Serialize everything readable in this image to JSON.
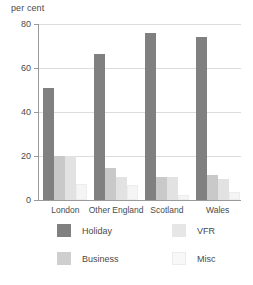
{
  "chart_data": {
    "type": "bar",
    "title": "",
    "subtitle": "",
    "xlabel": "",
    "ylabel": "per cent",
    "ylim": [
      0,
      80
    ],
    "yticks": [
      0,
      20,
      40,
      60,
      80
    ],
    "ytick_labels": [
      "0",
      "20",
      "40",
      "60",
      "80"
    ],
    "grid": true,
    "legend_position": "bottom",
    "categories": [
      "London",
      "Other England",
      "Scotland",
      "Wales"
    ],
    "series": [
      {
        "name": "Holiday",
        "color": "#808080",
        "values": [
          51,
          66.5,
          76,
          74
        ]
      },
      {
        "name": "Business",
        "color": "#c9c9c9",
        "values": [
          20,
          14.5,
          10.5,
          11.5
        ]
      },
      {
        "name": "VFR",
        "color": "#e2e2e2",
        "values": [
          20,
          10.5,
          10.5,
          9.5
        ]
      },
      {
        "name": "Misc",
        "color": "#f5f5f5",
        "values": [
          7.5,
          7,
          2.5,
          3.5
        ]
      }
    ]
  },
  "axis": {
    "y_title": "per cent"
  },
  "legend": {
    "items": [
      {
        "label": "Holiday",
        "key": "holiday"
      },
      {
        "label": "Business",
        "key": "business"
      },
      {
        "label": "VFR",
        "key": "vfr"
      },
      {
        "label": "Misc",
        "key": "misc"
      }
    ]
  }
}
